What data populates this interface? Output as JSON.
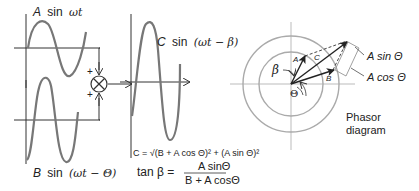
{
  "waveforms": {
    "a": {
      "label_coef": "A",
      "label_fn": "sin",
      "label_arg": "ωt"
    },
    "b": {
      "label_coef": "B",
      "label_fn": "sin",
      "label_arg": "(ωt − Θ)"
    },
    "c": {
      "label_coef": "C",
      "label_fn": "sin",
      "label_arg": "(ωt − β)"
    }
  },
  "summer": {
    "plus_top": "+",
    "plus_bottom": "+"
  },
  "equations": {
    "magnitude": "C = √(B + A cos Θ)² + (A sin Θ)²",
    "tan_lhs": "tan β =",
    "tan_num": "A sinΘ",
    "tan_den": "B + A cosΘ"
  },
  "phasor": {
    "vector_a": "A",
    "vector_b": "B",
    "vector_c": "C",
    "angle_beta": "β",
    "angle_theta": "Θ",
    "label_sin": "A sin Θ",
    "label_cos": "A cos Θ",
    "caption_line1": "Phasor",
    "caption_line2": "diagram"
  },
  "colors": {
    "wave": "#777777",
    "axis": "#333333",
    "circle": "#aaaaaa",
    "text": "#222222"
  }
}
